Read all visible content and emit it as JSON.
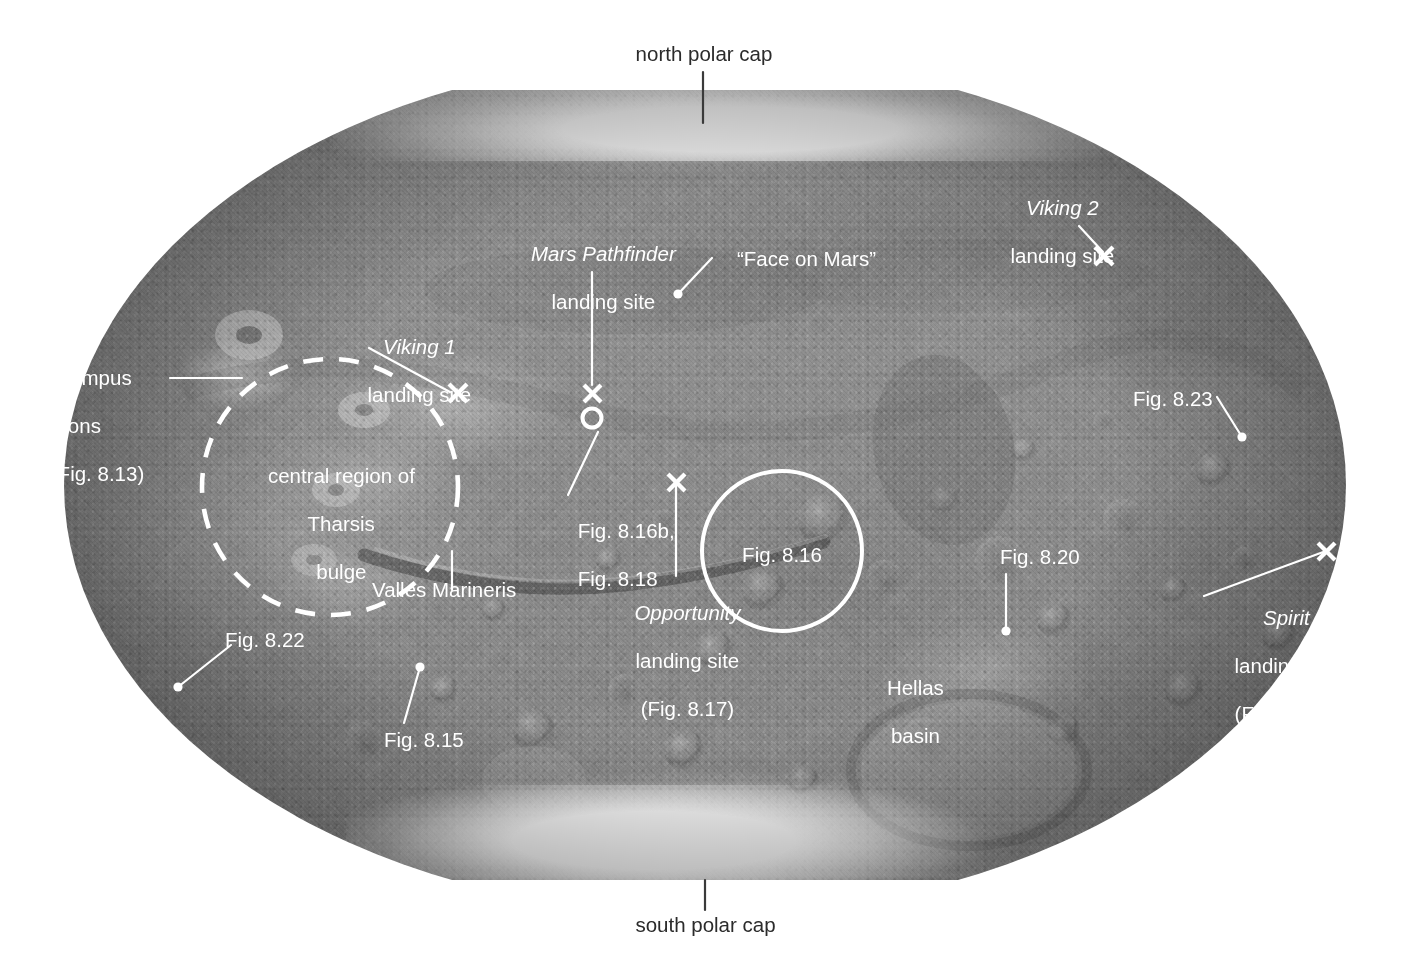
{
  "figure": {
    "projection": "oval (Mollweide-style) global map",
    "palette": {
      "label_light": "#ffffff",
      "label_dark": "#2b2b2b",
      "surface_mid": "#8b8b8b",
      "polar_cap": "#fefefe",
      "background": "#ffffff"
    }
  },
  "labels": {
    "north_polar_cap": "north polar cap",
    "south_polar_cap": "south polar cap",
    "viking2_name": "Viking 2",
    "viking2_sub": "landing site",
    "mars_pathfinder_name": "Mars Pathfinder",
    "mars_pathfinder_sub": "landing site",
    "face_on_mars": "“Face on Mars”",
    "viking1_name": "Viking 1",
    "viking1_sub": "landing site",
    "olympus_mons_l1": "Olympus",
    "olympus_mons_l2": "Mons",
    "olympus_mons_l3": "(Fig. 8.13)",
    "fig_8_23": "Fig. 8.23",
    "tharsis_l1": "central region of",
    "tharsis_l2": "Tharsis",
    "tharsis_l3": "bulge",
    "fig_8_16b": "Fig. 8.16b,",
    "fig_8_18": "Fig. 8.18",
    "fig_8_16": "Fig. 8.16",
    "fig_8_20": "Fig. 8.20",
    "spirit_name": "Spirit",
    "spirit_sub": "landing site",
    "spirit_fig": "(Fig. 8.16c)",
    "valles_marineris": "Valles Marineris",
    "opportunity_name": "Opportunity",
    "opportunity_sub": "landing site",
    "opportunity_fig": "(Fig. 8.17)",
    "fig_8_22": "Fig. 8.22",
    "fig_8_15": "Fig. 8.15",
    "hellas_l1": "Hellas",
    "hellas_l2": "basin"
  },
  "markers": {
    "x_cross": "x-cross-marker",
    "dot": "dot-marker",
    "circle_outline": "circle-outline-marker",
    "dashed_circle": "dashed-circle-region",
    "solid_circle": "solid-circle-region"
  },
  "annotated_features": [
    {
      "name": "north polar cap",
      "kind": "polar cap",
      "marker": "leader-line",
      "text_color": "dark"
    },
    {
      "name": "south polar cap",
      "kind": "polar cap",
      "marker": "leader-line",
      "text_color": "dark"
    },
    {
      "name": "Viking 2 landing site",
      "kind": "landing site",
      "marker": "x-cross"
    },
    {
      "name": "Viking 1 landing site",
      "kind": "landing site",
      "marker": "x-cross"
    },
    {
      "name": "Mars Pathfinder landing site",
      "kind": "landing site",
      "marker": "x-cross-over-circle"
    },
    {
      "name": "Opportunity landing site (Fig. 8.17)",
      "kind": "landing site",
      "marker": "x-cross"
    },
    {
      "name": "Spirit landing site (Fig. 8.16c)",
      "kind": "landing site",
      "marker": "x-cross"
    },
    {
      "name": "“Face on Mars”",
      "kind": "surface feature",
      "marker": "dot"
    },
    {
      "name": "Olympus Mons (Fig. 8.13)",
      "kind": "volcano",
      "marker": "leader-line"
    },
    {
      "name": "central region of Tharsis bulge",
      "kind": "region",
      "marker": "dashed-circle"
    },
    {
      "name": "Valles Marineris",
      "kind": "canyon system",
      "marker": "leader-line"
    },
    {
      "name": "Hellas basin",
      "kind": "impact basin",
      "marker": "label-only"
    },
    {
      "name": "Fig. 8.22",
      "kind": "figure reference",
      "marker": "dot"
    },
    {
      "name": "Fig. 8.15",
      "kind": "figure reference",
      "marker": "dot"
    },
    {
      "name": "Fig. 8.16b, Fig. 8.18",
      "kind": "figure reference",
      "marker": "leader-line"
    },
    {
      "name": "Fig. 8.16",
      "kind": "figure reference",
      "marker": "solid-circle"
    },
    {
      "name": "Fig. 8.20",
      "kind": "figure reference",
      "marker": "dot"
    },
    {
      "name": "Fig. 8.23",
      "kind": "figure reference",
      "marker": "dot"
    }
  ]
}
